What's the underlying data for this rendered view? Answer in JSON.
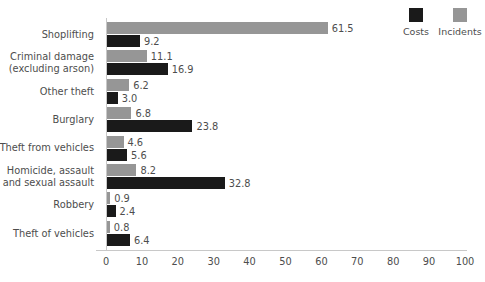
{
  "chart_data": {
    "type": "bar",
    "orientation": "horizontal",
    "title": "",
    "xlabel": "",
    "ylabel": "",
    "xlim": [
      0,
      100
    ],
    "xticks": [
      0,
      10,
      20,
      30,
      40,
      50,
      60,
      70,
      80,
      90,
      100
    ],
    "grid": false,
    "legend_position": "top-right",
    "categories": [
      "Shoplifting",
      "Criminal damage\n(excluding arson)",
      "Other theft",
      "Burglary",
      "Theft from vehicles",
      "Homicide, assault\nand sexual assault",
      "Robbery",
      "Theft of vehicles"
    ],
    "category_lines": [
      [
        "Shoplifting"
      ],
      [
        "Criminal damage",
        "(excluding arson)"
      ],
      [
        "Other theft"
      ],
      [
        "Burglary"
      ],
      [
        "Theft from vehicles"
      ],
      [
        "Homicide, assault",
        "and sexual assault"
      ],
      [
        "Robbery"
      ],
      [
        "Theft of vehicles"
      ]
    ],
    "series": [
      {
        "name": "Incidents",
        "color": "#969696",
        "values": [
          61.5,
          11.1,
          6.2,
          6.8,
          4.6,
          8.2,
          0.9,
          0.8
        ],
        "labels": [
          "61.5",
          "11.1",
          "6.2",
          "6.8",
          "4.6",
          "8.2",
          "0.9",
          "0.8"
        ]
      },
      {
        "name": "Costs",
        "color": "#1a1a1a",
        "values": [
          9.2,
          16.9,
          3.0,
          23.8,
          5.6,
          32.8,
          2.4,
          6.4
        ],
        "labels": [
          "9.2",
          "16.9",
          "3.0",
          "23.8",
          "5.6",
          "32.8",
          "2.4",
          "6.4"
        ]
      }
    ]
  },
  "legend": {
    "items": [
      {
        "label": "Costs",
        "color": "#1a1a1a"
      },
      {
        "label": "Incidents",
        "color": "#969696"
      }
    ]
  },
  "colors": {
    "incidents": "#969696",
    "costs": "#1a1a1a",
    "axis": "#c8c8c8",
    "text": "#4d4d4d",
    "background": "#ffffff"
  }
}
